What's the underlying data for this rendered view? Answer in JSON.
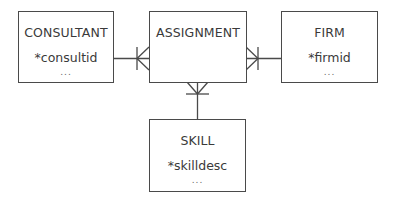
{
  "diagram": {
    "type": "entity-relationship",
    "entities": [
      {
        "id": "consultant",
        "title": "CONSULTANT",
        "attribute": "*consultid",
        "more": "..."
      },
      {
        "id": "assignment",
        "title": "ASSIGNMENT",
        "attribute": "",
        "more": ""
      },
      {
        "id": "firm",
        "title": "FIRM",
        "attribute": "*firmid",
        "more": "..."
      },
      {
        "id": "skill",
        "title": "SKILL",
        "attribute": "*skilldesc",
        "more": "..."
      }
    ],
    "relationships": [
      {
        "from": "consultant",
        "to": "assignment",
        "from_end": "one",
        "to_end": "many"
      },
      {
        "from": "firm",
        "to": "assignment",
        "from_end": "one",
        "to_end": "many"
      },
      {
        "from": "skill",
        "to": "assignment",
        "from_end": "one",
        "to_end": "many"
      }
    ],
    "colors": {
      "line": "#4a4a4a",
      "text": "#3a3a3a",
      "background": "#ffffff"
    }
  }
}
